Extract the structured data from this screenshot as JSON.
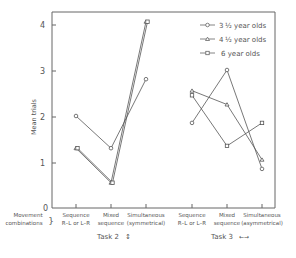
{
  "chart_data": {
    "type": "line",
    "title": "",
    "ylabel": "Mean trials",
    "xlabel": "Movement combinations",
    "ylim": [
      0,
      4.3
    ],
    "yticks": [
      "0",
      "1",
      "2",
      "3",
      "4"
    ],
    "grid": false,
    "legend_position": "top-right",
    "groups": [
      {
        "name": "Task 2",
        "label": "Task 2 ↕",
        "categories": [
          "Sequence R–L or L–R",
          "Mixed sequence",
          "Simultaneous (symmetrical)"
        ],
        "series": [
          {
            "name": "3½ year olds",
            "marker": "circle",
            "values": [
              2.0,
              1.3,
              2.8
            ]
          },
          {
            "name": "4½ year olds",
            "marker": "triangle",
            "values": [
              1.3,
              0.55,
              4.05
            ]
          },
          {
            "name": "6 year olds",
            "marker": "square",
            "values": [
              1.3,
              0.55,
              4.05
            ]
          }
        ]
      },
      {
        "name": "Task 3",
        "label": "Task 3 ←→",
        "categories": [
          "Sequence R–L or L–R",
          "Mixed sequence",
          "Simultaneous (asymmetrical)"
        ],
        "series": [
          {
            "name": "3½ year olds",
            "marker": "circle",
            "values": [
              1.85,
              3.0,
              0.85
            ]
          },
          {
            "name": "4½ year olds",
            "marker": "triangle",
            "values": [
              2.55,
              2.25,
              1.05
            ]
          },
          {
            "name": "6 year olds",
            "marker": "square",
            "values": [
              2.45,
              1.35,
              1.85
            ]
          }
        ]
      }
    ]
  },
  "labels": {
    "ylabel": "Mean trials",
    "xrow_label_1": "Movement",
    "xrow_label_2": "combinations",
    "task2": "Task 2",
    "task2_sym": "↕",
    "task3": "Task 3",
    "task3_sym": "←→",
    "cat_seq_1": "Sequence",
    "cat_seq_2": "R–L or L–R",
    "cat_mixed_1": "Mixed",
    "cat_mixed_2": "sequence",
    "cat_sim_1": "Simultaneous",
    "cat_sym_2": "(symmetrical)",
    "cat_asym_2": "(asymmetrical)",
    "legend_1_a": "3",
    "legend_1_b": "½ year olds",
    "legend_2_a": "4",
    "legend_2_b": "½ year olds",
    "legend_3": "6  year olds",
    "y0": "0",
    "y1": "1",
    "y2": "2",
    "y3": "3",
    "y4": "4"
  }
}
